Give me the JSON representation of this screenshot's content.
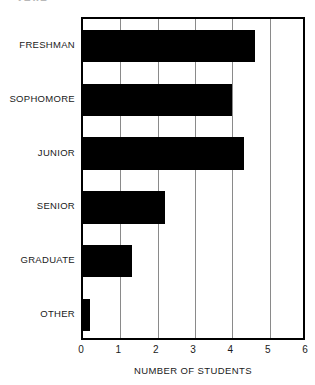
{
  "cropped_header": "YEAR",
  "chart_data": {
    "type": "bar",
    "orientation": "horizontal",
    "title": "",
    "xlabel": "NUMBER OF STUDENTS",
    "ylabel": "",
    "categories": [
      "FRESHMAN",
      "SOPHOMORE",
      "JUNIOR",
      "SENIOR",
      "GRADUATE",
      "OTHER"
    ],
    "values": [
      4.6,
      4.0,
      4.3,
      2.2,
      1.3,
      0.2
    ],
    "xlim": [
      0,
      6
    ],
    "xticks": [
      0,
      1,
      2,
      3,
      4,
      5,
      6
    ],
    "xticklabels": [
      "0",
      "1",
      "2",
      "3",
      "4",
      "5",
      "6"
    ],
    "grid": true,
    "grid_axis": "x",
    "legend": false,
    "bar_color": "#000000",
    "frame_color": "#000000",
    "gridline_color": "#8a8a8a",
    "background_color": "#ffffff"
  }
}
